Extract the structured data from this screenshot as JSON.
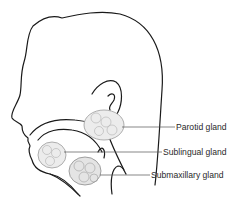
{
  "diagram": {
    "labels": [
      {
        "id": "parotid",
        "text": "Parotid gland"
      },
      {
        "id": "sublingual",
        "text": "Sublingual gland"
      },
      {
        "id": "submaxillary",
        "text": "Submaxillary gland"
      }
    ],
    "colors": {
      "outline": "#1a1a1a",
      "gland_fill": "#ececec",
      "gland_stroke": "#9a9a9a",
      "leader": "#555555",
      "text": "#2a2a2a"
    }
  }
}
